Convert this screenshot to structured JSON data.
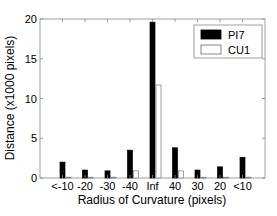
{
  "chart_data": {
    "type": "bar",
    "title": "",
    "xlabel": "Radius of Curvature (pixels)",
    "ylabel": "Distance (x1000 pixels)",
    "categories": [
      "<-10",
      "-20",
      "-30",
      "-40",
      "Inf",
      "40",
      "30",
      "20",
      "<10"
    ],
    "series": [
      {
        "name": "PI7",
        "color": "#000000",
        "values": [
          2.0,
          1.0,
          0.9,
          3.5,
          19.6,
          3.8,
          1.0,
          1.4,
          2.6
        ]
      },
      {
        "name": "CU1",
        "color": "#ffffff",
        "values": [
          0.1,
          0.1,
          0.1,
          0.9,
          11.7,
          0.9,
          0.1,
          0.1,
          0.1
        ]
      }
    ],
    "ylim": [
      0,
      20
    ],
    "yticks": [
      0,
      5,
      10,
      15,
      20
    ],
    "grid": false,
    "legend_position": "upper right"
  },
  "legend": {
    "items": [
      {
        "label": "PI7",
        "fill": "#000000"
      },
      {
        "label": "CU1",
        "fill": "#ffffff"
      }
    ]
  }
}
